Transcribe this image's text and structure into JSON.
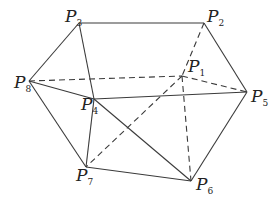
{
  "diagram": {
    "colors": {
      "stroke": "#3a3a3a",
      "text": "#222222",
      "background": "#ffffff"
    },
    "vertices": [
      {
        "id": "P1",
        "letter": "P",
        "sub": "1",
        "x": 182,
        "y": 76,
        "lx": 188,
        "ly": 72,
        "hidden": true
      },
      {
        "id": "P2",
        "letter": "P",
        "sub": "2",
        "x": 204,
        "y": 23,
        "lx": 207,
        "ly": 22
      },
      {
        "id": "P3",
        "letter": "P",
        "sub": "3",
        "x": 79,
        "y": 23,
        "lx": 65,
        "ly": 22
      },
      {
        "id": "P4",
        "letter": "P",
        "sub": "4",
        "x": 94,
        "y": 99,
        "lx": 81,
        "ly": 110
      },
      {
        "id": "P5",
        "letter": "P",
        "sub": "5",
        "x": 247,
        "y": 92,
        "lx": 251,
        "ly": 102
      },
      {
        "id": "P6",
        "letter": "P",
        "sub": "6",
        "x": 191,
        "y": 181,
        "lx": 196,
        "ly": 190
      },
      {
        "id": "P7",
        "letter": "P",
        "sub": "7",
        "x": 86,
        "y": 167,
        "lx": 76,
        "ly": 181
      },
      {
        "id": "P8",
        "letter": "P",
        "sub": "8",
        "x": 29,
        "y": 81,
        "lx": 14,
        "ly": 88
      }
    ],
    "edges_solid": [
      [
        "P3",
        "P2"
      ],
      [
        "P3",
        "P8"
      ],
      [
        "P3",
        "P4"
      ],
      [
        "P2",
        "P5"
      ],
      [
        "P8",
        "P4"
      ],
      [
        "P8",
        "P7"
      ],
      [
        "P4",
        "P5"
      ],
      [
        "P4",
        "P7"
      ],
      [
        "P4",
        "P6"
      ],
      [
        "P7",
        "P6"
      ],
      [
        "P5",
        "P6"
      ]
    ],
    "edges_dashed": [
      [
        "P8",
        "P1"
      ],
      [
        "P2",
        "P1"
      ],
      [
        "P1",
        "P5"
      ],
      [
        "P1",
        "P7"
      ],
      [
        "P1",
        "P6"
      ]
    ]
  }
}
